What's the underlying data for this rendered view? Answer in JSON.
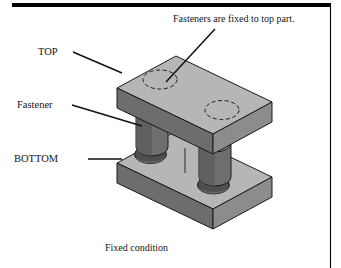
{
  "figure": {
    "name": "fixed-condition-fastener-diagram",
    "bottom_caption": "Fixed condition",
    "note": "Fasteners are fixed to top part.",
    "labels": {
      "top": "TOP",
      "fastener": "Fastener",
      "bottom": "BOTTOM"
    },
    "parts": [
      {
        "id": "top-plate",
        "label": "TOP",
        "holes": 2,
        "hole_style": "dashed-hidden-circle"
      },
      {
        "id": "fastener",
        "label": "Fastener",
        "count": 2,
        "shape": "cylinder"
      },
      {
        "id": "bottom-plate",
        "label": "BOTTOM",
        "holes": 2,
        "hole_style": "solid-through-hole"
      }
    ],
    "colors": {
      "top_face": "#b3b3b3",
      "front_face": "#8a8a8a",
      "side_face": "#6f6f6f",
      "hole_dark": "#4a4a4a",
      "hole_shade": "#5e5e5e",
      "outline": "#1a1a1a",
      "rule": "#000000",
      "background": "#ffffff"
    },
    "rules": {
      "top_rule": "thick-horizontal-rule",
      "right_rule": "thin-vertical-rule"
    }
  }
}
